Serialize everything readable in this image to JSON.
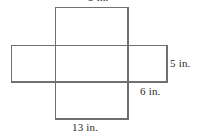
{
  "figure": {
    "name": "box-net-diagram",
    "type": "geometry-net",
    "background_color": "#ffffff",
    "stroke_color": "#707070",
    "text_color": "#2b2b2b",
    "shapes": {
      "vertical_column": {
        "x": 55,
        "y": 8,
        "width": 73,
        "height": 111
      },
      "horizontal_band": {
        "x": 11,
        "y": 45,
        "width": 156,
        "height": 37
      }
    },
    "labels": {
      "top_width": "5 in.",
      "right_height": "5 in.",
      "right_width": "6 in.",
      "bottom_width": "13 in."
    }
  }
}
